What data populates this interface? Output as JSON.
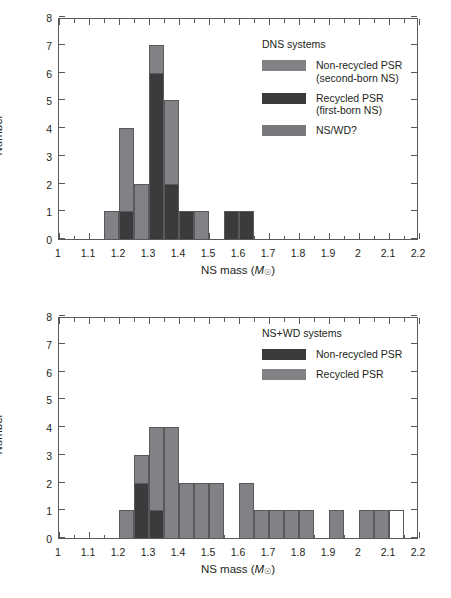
{
  "figure": {
    "axis_title_x_prefix": "NS mass (",
    "axis_title_x_symbol": "M",
    "axis_title_x_sub": "☉",
    "axis_title_x_suffix": ")",
    "axis_title_y": "Number"
  },
  "panels": [
    {
      "id": "dns-panel",
      "legend_title": "DNS systems",
      "legend_items": [
        {
          "swatch": "light",
          "label_line1": "Non-recycled PSR",
          "label_line2": "(second-born NS)"
        },
        {
          "swatch": "dark",
          "label_line1": "Recycled PSR",
          "label_line2": "(first-born NS)"
        },
        {
          "swatch": "nswd",
          "label_line1": "NS/WD?",
          "label_line2": ""
        }
      ]
    },
    {
      "id": "nswd-panel",
      "legend_title": "NS+WD systems",
      "legend_items": [
        {
          "swatch": "dark",
          "label_line1": "Non-recycled PSR",
          "label_line2": ""
        },
        {
          "swatch": "light",
          "label_line1": "Recycled PSR",
          "label_line2": ""
        }
      ]
    }
  ],
  "chart_data": [
    {
      "type": "bar",
      "id": "dns-systems-histogram",
      "title": "DNS systems",
      "xlabel": "NS mass (M_sun)",
      "ylabel": "Number",
      "xlim": [
        1.0,
        2.2
      ],
      "ylim": [
        0,
        8
      ],
      "xticks": [
        1,
        1.1,
        1.2,
        1.3,
        1.4,
        1.5,
        1.6,
        1.7,
        1.8,
        1.9,
        2,
        2.1,
        2.2
      ],
      "xtick_labels": [
        "1",
        "1.1",
        "1.2",
        "1.3",
        "1.4",
        "1.5",
        "1.6",
        "1.7",
        "1.8",
        "1.9",
        "2",
        "2.1",
        "2.2"
      ],
      "yticks": [
        0,
        1,
        2,
        3,
        4,
        5,
        6,
        7,
        8
      ],
      "ytick_labels": [
        "0",
        "1",
        "2",
        "3",
        "4",
        "5",
        "6",
        "7",
        "8"
      ],
      "bin_width": 0.05,
      "grid": false,
      "legend_position": "upper-right",
      "series": [
        {
          "name": "Non-recycled PSR (second-born NS)",
          "color": "#808285",
          "key": "light"
        },
        {
          "name": "Recycled PSR (first-born NS)",
          "color": "#3b3b3d",
          "key": "dark"
        },
        {
          "name": "NS/WD?",
          "color": "#78797c",
          "key": "nswd"
        }
      ],
      "bins": [
        {
          "x0": 1.15,
          "x1": 1.2,
          "light": 1,
          "dark": 0,
          "total": 1
        },
        {
          "x0": 1.2,
          "x1": 1.25,
          "light": 3,
          "dark": 1,
          "total": 4
        },
        {
          "x0": 1.25,
          "x1": 1.3,
          "light": 2,
          "dark": 0,
          "total": 2
        },
        {
          "x0": 1.3,
          "x1": 1.35,
          "light": 1,
          "dark": 6,
          "total": 7
        },
        {
          "x0": 1.35,
          "x1": 1.4,
          "light": 3,
          "dark": 2,
          "total": 5
        },
        {
          "x0": 1.4,
          "x1": 1.45,
          "light": 0,
          "dark": 1,
          "total": 1
        },
        {
          "x0": 1.45,
          "x1": 1.5,
          "light": 1,
          "dark": 0,
          "total": 1
        },
        {
          "x0": 1.55,
          "x1": 1.6,
          "light": 0,
          "dark": 1,
          "total": 1
        },
        {
          "x0": 1.6,
          "x1": 1.65,
          "light": 0,
          "dark": 1,
          "total": 1
        }
      ]
    },
    {
      "type": "bar",
      "id": "ns-wd-systems-histogram",
      "title": "NS+WD systems",
      "xlabel": "NS mass (M_sun)",
      "ylabel": "Number",
      "xlim": [
        1.0,
        2.2
      ],
      "ylim": [
        0,
        8
      ],
      "xticks": [
        1,
        1.1,
        1.2,
        1.3,
        1.4,
        1.5,
        1.6,
        1.7,
        1.8,
        1.9,
        2,
        2.1,
        2.2
      ],
      "xtick_labels": [
        "1",
        "1.1",
        "1.2",
        "1.3",
        "1.4",
        "1.5",
        "1.6",
        "1.7",
        "1.8",
        "1.9",
        "2",
        "2.1",
        "2.2"
      ],
      "yticks": [
        0,
        1,
        2,
        3,
        4,
        5,
        6,
        7,
        8
      ],
      "ytick_labels": [
        "0",
        "1",
        "2",
        "3",
        "4",
        "5",
        "6",
        "7",
        "8"
      ],
      "bin_width": 0.05,
      "grid": false,
      "legend_position": "upper-right",
      "series": [
        {
          "name": "Non-recycled PSR",
          "color": "#3b3b3d",
          "key": "dark"
        },
        {
          "name": "Recycled PSR",
          "color": "#808285",
          "key": "light"
        }
      ],
      "bins": [
        {
          "x0": 1.2,
          "x1": 1.25,
          "light": 1,
          "dark": 0,
          "empty": 0,
          "total": 1
        },
        {
          "x0": 1.25,
          "x1": 1.3,
          "light": 1,
          "dark": 2,
          "empty": 0,
          "total": 3
        },
        {
          "x0": 1.3,
          "x1": 1.35,
          "light": 3,
          "dark": 1,
          "empty": 0,
          "total": 4
        },
        {
          "x0": 1.35,
          "x1": 1.4,
          "light": 4,
          "dark": 0,
          "empty": 0,
          "total": 4
        },
        {
          "x0": 1.4,
          "x1": 1.45,
          "light": 2,
          "dark": 0,
          "empty": 0,
          "total": 2
        },
        {
          "x0": 1.45,
          "x1": 1.5,
          "light": 2,
          "dark": 0,
          "empty": 0,
          "total": 2
        },
        {
          "x0": 1.5,
          "x1": 1.55,
          "light": 2,
          "dark": 0,
          "empty": 0,
          "total": 2
        },
        {
          "x0": 1.6,
          "x1": 1.65,
          "light": 2,
          "dark": 0,
          "empty": 0,
          "total": 2
        },
        {
          "x0": 1.65,
          "x1": 1.7,
          "light": 1,
          "dark": 0,
          "empty": 0,
          "total": 1
        },
        {
          "x0": 1.7,
          "x1": 1.75,
          "light": 1,
          "dark": 0,
          "empty": 0,
          "total": 1
        },
        {
          "x0": 1.75,
          "x1": 1.8,
          "light": 1,
          "dark": 0,
          "empty": 0,
          "total": 1
        },
        {
          "x0": 1.8,
          "x1": 1.85,
          "light": 1,
          "dark": 0,
          "empty": 0,
          "total": 1
        },
        {
          "x0": 1.9,
          "x1": 1.95,
          "light": 1,
          "dark": 0,
          "empty": 0,
          "total": 1
        },
        {
          "x0": 2.0,
          "x1": 2.05,
          "light": 1,
          "dark": 0,
          "empty": 0,
          "total": 1
        },
        {
          "x0": 2.05,
          "x1": 2.1,
          "light": 1,
          "dark": 0,
          "empty": 0,
          "total": 1
        },
        {
          "x0": 2.1,
          "x1": 2.15,
          "light": 0,
          "dark": 0,
          "empty": 1,
          "total": 1
        }
      ]
    }
  ]
}
